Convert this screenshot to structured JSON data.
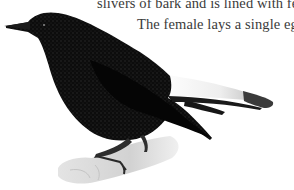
{
  "caption": {
    "lines": [
      "slivers of bark and is lined with feathers.",
      "The female lays a single egg."
    ]
  },
  "illustration": {
    "subject": "black bird with white tail patch perched on pale rock",
    "colors": {
      "body": "#0b0b0b",
      "speckle": "#2a2a2a",
      "tail_patch": "#f2f2f2",
      "tail_tip": "#3c3c3c",
      "perch": "#d9d9d9",
      "legs": "#2e2e2e"
    }
  }
}
